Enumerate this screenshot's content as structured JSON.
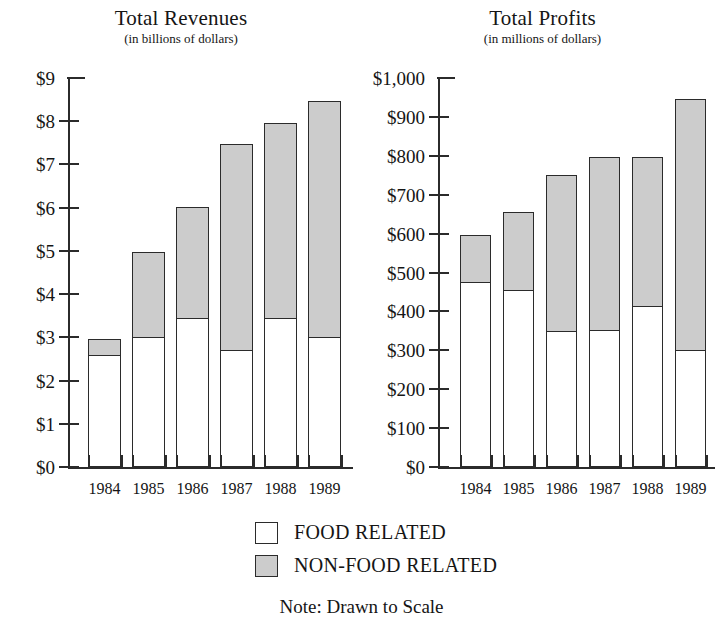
{
  "legend": {
    "items": [
      {
        "label": "FOOD RELATED",
        "key": "food",
        "color": "#ffffff"
      },
      {
        "label": "NON-FOOD RELATED",
        "key": "nonfood",
        "color": "#cccccc"
      }
    ]
  },
  "note": "Note: Drawn to Scale",
  "chart_data": [
    {
      "type": "bar",
      "id": "total-revenues",
      "title": "Total Revenues",
      "subtitle": "(in billions of dollars)",
      "stacked": true,
      "xlabel": "",
      "ylabel": "",
      "ylim": [
        0,
        9
      ],
      "ytick_step": 1,
      "grid": false,
      "legend_position": "bottom",
      "categories": [
        "1984",
        "1985",
        "1986",
        "1987",
        "1988",
        "1989"
      ],
      "ytick_labels": [
        "$0",
        "$1",
        "$2",
        "$3",
        "$4",
        "$5",
        "$6",
        "$7",
        "$8",
        "$9"
      ],
      "ytick_values": [
        0,
        1,
        2,
        3,
        4,
        5,
        6,
        7,
        8,
        9
      ],
      "series": [
        {
          "name": "FOOD RELATED",
          "values": [
            2.6,
            3.0,
            3.45,
            2.7,
            3.45,
            3.0
          ]
        },
        {
          "name": "NON-FOOD RELATED",
          "values": [
            0.4,
            2.0,
            2.6,
            4.8,
            4.55,
            5.5
          ]
        }
      ],
      "totals": [
        3.0,
        5.0,
        6.05,
        7.5,
        8.0,
        8.5
      ]
    },
    {
      "type": "bar",
      "id": "total-profits",
      "title": "Total Profits",
      "subtitle": "(in millions of dollars)",
      "stacked": true,
      "xlabel": "",
      "ylabel": "",
      "ylim": [
        0,
        1000
      ],
      "ytick_step": 100,
      "grid": false,
      "legend_position": "bottom",
      "categories": [
        "1984",
        "1985",
        "1986",
        "1987",
        "1988",
        "1989"
      ],
      "ytick_labels": [
        "$0",
        "$100",
        "$200",
        "$300",
        "$400",
        "$500",
        "$600",
        "$700",
        "$800",
        "$900",
        "$1,000"
      ],
      "ytick_values": [
        0,
        100,
        200,
        300,
        400,
        500,
        600,
        700,
        800,
        900,
        1000
      ],
      "series": [
        {
          "name": "FOOD RELATED",
          "values": [
            475,
            455,
            350,
            352,
            415,
            300
          ]
        },
        {
          "name": "NON-FOOD RELATED",
          "values": [
            125,
            205,
            405,
            448,
            385,
            650
          ]
        }
      ],
      "totals": [
        600,
        660,
        755,
        800,
        800,
        950
      ]
    }
  ]
}
